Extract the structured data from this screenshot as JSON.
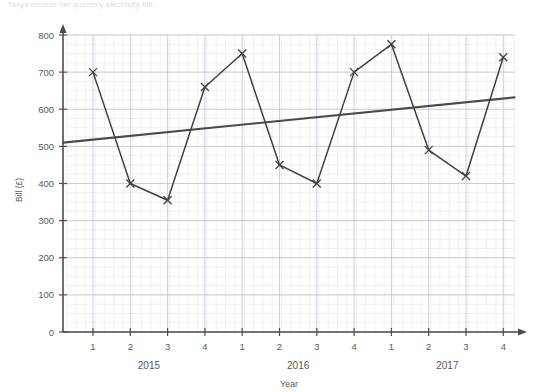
{
  "page": {
    "faint_header": "Tanya records her quarterly electricity bill."
  },
  "chart_data": {
    "type": "line",
    "title": "",
    "xlabel": "Year",
    "ylabel": "Bill (£)",
    "ylim": [
      0,
      800
    ],
    "ytick_step": 100,
    "yticks": [
      "0",
      "100",
      "200",
      "300",
      "400",
      "500",
      "600",
      "700",
      "800"
    ],
    "grid": true,
    "grid_minor": true,
    "legend": "none",
    "categories": [
      "1",
      "2",
      "3",
      "4",
      "1",
      "2",
      "3",
      "4",
      "1",
      "2",
      "3",
      "4"
    ],
    "group_labels": [
      "2015",
      "2016",
      "2017"
    ],
    "group_spans": [
      4,
      4,
      4
    ],
    "marker": "cross",
    "series": [
      {
        "name": "Quarterly bill",
        "color": "#404040",
        "values": [
          700,
          400,
          355,
          660,
          750,
          450,
          400,
          700,
          775,
          490,
          420,
          740
        ]
      }
    ],
    "trend_line": {
      "name": "Line of best fit",
      "color": "#4a4a4a",
      "start": {
        "x_index": -0.8,
        "y": 510
      },
      "end": {
        "x_index": 11.3,
        "y": 632
      }
    },
    "points": [
      {
        "year": "2015",
        "quarter": "1",
        "value": 700
      },
      {
        "year": "2015",
        "quarter": "2",
        "value": 400
      },
      {
        "year": "2015",
        "quarter": "3",
        "value": 355
      },
      {
        "year": "2015",
        "quarter": "4",
        "value": 660
      },
      {
        "year": "2016",
        "quarter": "1",
        "value": 750
      },
      {
        "year": "2016",
        "quarter": "2",
        "value": 450
      },
      {
        "year": "2016",
        "quarter": "3",
        "value": 400
      },
      {
        "year": "2016",
        "quarter": "4",
        "value": 700
      },
      {
        "year": "2017",
        "quarter": "1",
        "value": 775
      },
      {
        "year": "2017",
        "quarter": "2",
        "value": 490
      },
      {
        "year": "2017",
        "quarter": "3",
        "value": 420
      },
      {
        "year": "2017",
        "quarter": "4",
        "value": 740
      }
    ],
    "colors": {
      "grid_minor": "#e2e6ee",
      "grid_major": "#c3c8d4",
      "axis": "#4d4d4d",
      "series": "#404040",
      "trend": "#4a4a4a"
    }
  }
}
